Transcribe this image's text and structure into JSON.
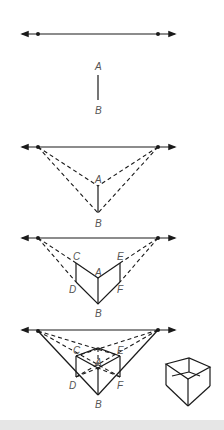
{
  "figure": {
    "colors": {
      "ink": "#1a1a1a",
      "label": "#555555",
      "footer": "#e6e6e6"
    }
  },
  "labels": {
    "step2": {
      "A": "A",
      "B": "B"
    },
    "step3": {
      "A": "A",
      "B": "B"
    },
    "step4": {
      "A": "A",
      "B": "B",
      "C": "C",
      "D": "D",
      "E": "E",
      "F": "F"
    },
    "step5": {
      "A": "A",
      "B": "B",
      "C": "C",
      "D": "D",
      "E": "E",
      "F": "F"
    }
  }
}
